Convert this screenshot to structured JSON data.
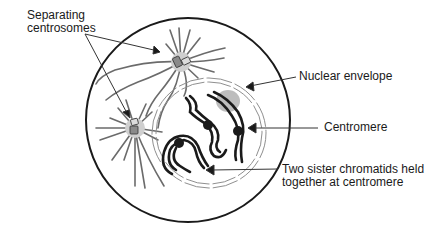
{
  "diagram": {
    "colors": {
      "ink": "#1a1a1a",
      "spindle": "#6b6b6b",
      "centrosome_halo": "#cfcfcf",
      "centriole": "#8a8a8a",
      "nucleolus": "#bdbdbd",
      "envelope": "#8f8f8f"
    },
    "labels": {
      "centrosomes": {
        "line1": "Separating",
        "line2": "centrosomes"
      },
      "nuclear_envelope": "Nuclear envelope",
      "centromere": "Centromere",
      "chromatids": {
        "line1": "Two sister chromatids held",
        "line2": "together at centromere"
      }
    }
  }
}
